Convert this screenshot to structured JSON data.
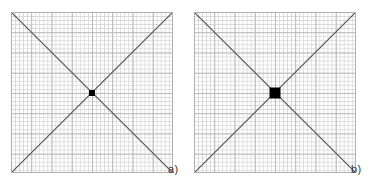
{
  "figure": {
    "background_color": "#ffffff",
    "grid_minor_color": "#d8d8d8",
    "grid_major_color": "#b9b9b9",
    "border_color": "#b0b0b0",
    "diagonal_color": "#555555",
    "marker_color": "#000000"
  },
  "panels": [
    {
      "id": "a",
      "label": "a)",
      "grid_cells_x": 40,
      "grid_cells_y": 40,
      "marker_size_px": 6,
      "marker_position": "center",
      "diagonals": [
        "top-left-to-bottom-right",
        "bottom-left-to-top-right"
      ]
    },
    {
      "id": "b",
      "label": "b)",
      "grid_cells_x": 40,
      "grid_cells_y": 40,
      "marker_size_px": 11,
      "marker_position": "center",
      "diagonals": [
        "top-left-to-bottom-right",
        "bottom-left-to-top-right"
      ]
    }
  ],
  "chart_data": {
    "type": "diagram",
    "title": "",
    "subfigures": [
      {
        "label": "a)",
        "marker_size_px": 6,
        "marker_size_cells": 1.5,
        "center_x_frac": 0.5,
        "center_y_frac": 0.5
      },
      {
        "label": "b)",
        "marker_size_px": 11,
        "marker_size_cells": 2.7,
        "center_x_frac": 0.5,
        "center_y_frac": 0.5
      }
    ],
    "xlabel": "",
    "ylabel": "",
    "legend": [],
    "grid": true
  }
}
